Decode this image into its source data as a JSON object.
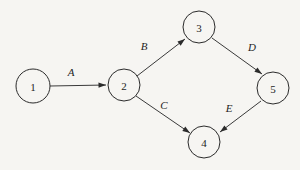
{
  "diagram": {
    "background_color": "#f6f5f2",
    "stroke_color": "#2b2b2b",
    "text_color": "#1e1e1e",
    "nodes": [
      {
        "id": "1",
        "label": "1",
        "cx": 33,
        "cy": 86,
        "r": 17
      },
      {
        "id": "2",
        "label": "2",
        "cx": 124,
        "cy": 85,
        "r": 16
      },
      {
        "id": "3",
        "label": "3",
        "cx": 199,
        "cy": 27,
        "r": 16
      },
      {
        "id": "4",
        "label": "4",
        "cx": 204,
        "cy": 142,
        "r": 16
      },
      {
        "id": "5",
        "label": "5",
        "cx": 273,
        "cy": 88,
        "r": 16
      }
    ],
    "edges": [
      {
        "id": "A",
        "label": "A",
        "from": "1",
        "to": "2",
        "x1": 50,
        "y1": 86,
        "x2": 106,
        "y2": 85,
        "label_x": 71,
        "label_y": 72
      },
      {
        "id": "B",
        "label": "B",
        "from": "2",
        "to": "3",
        "x1": 137,
        "y1": 76,
        "x2": 185,
        "y2": 39,
        "label_x": 144,
        "label_y": 46
      },
      {
        "id": "C",
        "label": "C",
        "from": "2",
        "to": "4",
        "x1": 136,
        "y1": 96,
        "x2": 190,
        "y2": 133,
        "label_x": 164,
        "label_y": 105
      },
      {
        "id": "D",
        "label": "D",
        "from": "3",
        "to": "5",
        "x1": 212,
        "y1": 38,
        "x2": 262,
        "y2": 74,
        "label_x": 252,
        "label_y": 47
      },
      {
        "id": "E",
        "label": "E",
        "from": "5",
        "to": "4",
        "x1": 261,
        "y1": 101,
        "x2": 220,
        "y2": 132,
        "label_x": 229,
        "label_y": 108
      }
    ]
  }
}
